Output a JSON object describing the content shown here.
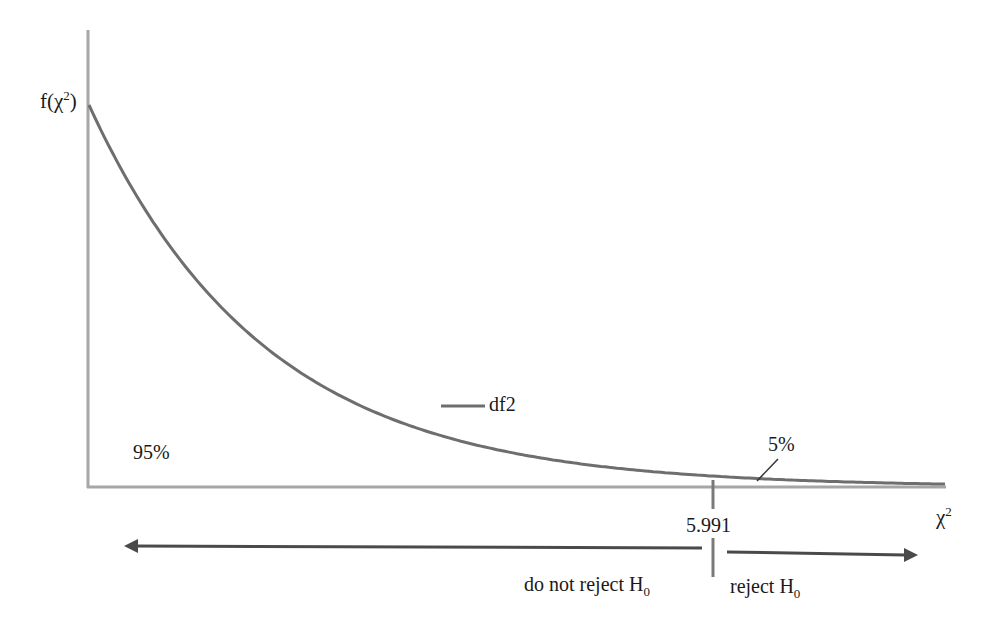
{
  "chart_data": {
    "type": "line",
    "title": "",
    "xlabel": "χ²",
    "ylabel": "f(χ²)",
    "series": [
      {
        "name": "df2",
        "distribution": "chi-square",
        "df": 2,
        "x": [
          0,
          0.5,
          1,
          1.5,
          2,
          2.5,
          3,
          3.5,
          4,
          4.5,
          5,
          5.5,
          5.991,
          6.5,
          7,
          7.5,
          8.1
        ],
        "values": [
          0.5,
          0.389,
          0.303,
          0.236,
          0.184,
          0.143,
          0.112,
          0.087,
          0.068,
          0.053,
          0.041,
          0.032,
          0.025,
          0.019,
          0.015,
          0.012,
          0.009
        ]
      }
    ],
    "critical_value": 5.991,
    "regions": [
      {
        "label": "95%",
        "side": "left"
      },
      {
        "label": "5%",
        "side": "right"
      }
    ],
    "legend": {
      "entries": [
        "df2"
      ],
      "position": "inside-center"
    },
    "grid": false
  },
  "labels": {
    "y_axis": "f(χ",
    "y_axis_sup": "2",
    "y_axis_close": ")",
    "x_axis": "χ",
    "x_axis_sup": "2",
    "legend": "df2",
    "left_pct": "95%",
    "right_pct": "5%",
    "critical": "5.991",
    "do_not_reject": "do not reject H",
    "reject": "reject H",
    "h_sub": "0"
  },
  "colors": {
    "curve": "#6e6e6e",
    "axis": "#a0a0a0",
    "arrow": "#4a4a4a"
  }
}
